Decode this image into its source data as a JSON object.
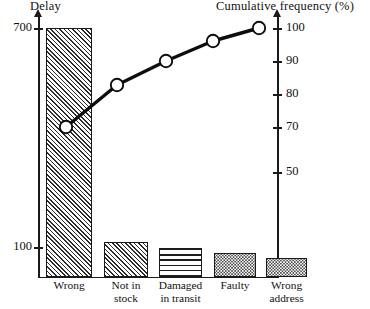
{
  "chart_data": {
    "type": "bar",
    "title": "",
    "subtitle": "",
    "categories": [
      "Wrong",
      "Not in stock",
      "Damaged in transit",
      "Faulty",
      "Wrong address"
    ],
    "category_lines": [
      [
        "Wrong"
      ],
      [
        "Not in",
        "stock"
      ],
      [
        "Damaged",
        "in transit"
      ],
      [
        "Faulty"
      ],
      [
        "Wrong",
        "address"
      ]
    ],
    "values": [
      700,
      100,
      85,
      68,
      55
    ],
    "bar_patterns": [
      "diagonal-hatch",
      "diagonal-hatch",
      "horizontal-lines",
      "stipple-dots",
      "stipple-dots"
    ],
    "series": [
      {
        "name": "Delay",
        "type": "bar",
        "values": [
          700,
          100,
          85,
          68,
          55
        ]
      },
      {
        "name": "Cumulative frequency (%)",
        "type": "line",
        "values": [
          70,
          83,
          90,
          96,
          100
        ]
      }
    ],
    "xlabel": "",
    "ylabel": "Delay",
    "y2label": "Cumulative frequency (%)",
    "ylim": [
      0,
      740
    ],
    "y2lim": [
      0,
      107
    ],
    "yticks": [
      100,
      700
    ],
    "ytick_labels": [
      "100",
      "700"
    ],
    "y2ticks": [
      50,
      70,
      80,
      90,
      100
    ],
    "y2tick_labels": [
      "50",
      "70",
      "80",
      "90",
      "100"
    ],
    "grid": false,
    "legend": "none",
    "marker": "open-circle"
  },
  "axes": {
    "left_title": "Delay",
    "right_title": "Cumulative frequency (%)",
    "left_ticks": [
      {
        "label": "700",
        "top": 28
      },
      {
        "label": "100",
        "top": 247
      }
    ],
    "right_ticks": [
      {
        "label": "100",
        "top": 28
      },
      {
        "label": "90",
        "top": 61
      },
      {
        "label": "80",
        "top": 94
      },
      {
        "label": "70",
        "top": 127
      },
      {
        "label": "50",
        "top": 172
      }
    ]
  },
  "bars": [
    {
      "label": "Wrong",
      "left": 46,
      "width": 46,
      "height": 249,
      "pattern": "pat-diag"
    },
    {
      "label": "Not in stock",
      "left": 104,
      "width": 44,
      "height": 35,
      "pattern": "pat-diag"
    },
    {
      "label": "Damaged in transit",
      "left": 159,
      "width": 43,
      "height": 29,
      "pattern": "pat-horiz"
    },
    {
      "label": "Faulty",
      "left": 214,
      "width": 42,
      "height": 24,
      "pattern": "pat-dots"
    },
    {
      "label": "Wrong address",
      "left": 266,
      "width": 41,
      "height": 19,
      "pattern": "pat-dots"
    }
  ],
  "cumulative_points": [
    {
      "value": 70,
      "cx": 66,
      "cy": 127
    },
    {
      "value": 83,
      "cx": 117,
      "cy": 85
    },
    {
      "value": 90,
      "cx": 166,
      "cy": 61
    },
    {
      "value": 96,
      "cx": 213,
      "cy": 41
    },
    {
      "value": 100,
      "cx": 259,
      "cy": 28
    }
  ],
  "colors": {
    "ink": "#1a1a1a",
    "background": "#ffffff",
    "marker_fill": "#ffffff",
    "line": "#0d0d0d"
  }
}
